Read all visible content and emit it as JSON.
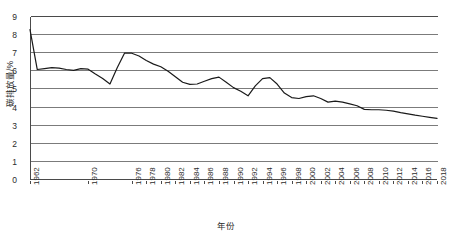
{
  "chart_data": {
    "type": "line",
    "title": "",
    "xlabel": "年份",
    "ylabel": "碳排放量/%",
    "xlim": [
      1962,
      2018
    ],
    "ylim": [
      0,
      9
    ],
    "grid": true,
    "legend": "none",
    "y_ticks": [
      9,
      8,
      7,
      6,
      5,
      4,
      3,
      2,
      1,
      0
    ],
    "x_ticks": [
      "1962",
      "1970",
      "1976",
      "1978",
      "1980",
      "1982",
      "1984",
      "1986",
      "1988",
      "1990",
      "1992",
      "1994",
      "1996",
      "1998",
      "2000",
      "2002",
      "2004",
      "2006",
      "2008",
      "2010",
      "2012",
      "2014",
      "2016",
      "2018"
    ],
    "line_color": "#1a1a1a",
    "grid_color": "#7b7b7b",
    "axis_color": "#4a4a4a",
    "series": [
      {
        "name": "碳排放量",
        "x": [
          1962,
          1963,
          1964,
          1965,
          1966,
          1967,
          1968,
          1969,
          1970,
          1971,
          1972,
          1973,
          1974,
          1975,
          1976,
          1977,
          1978,
          1979,
          1980,
          1981,
          1982,
          1983,
          1984,
          1985,
          1986,
          1987,
          1988,
          1989,
          1990,
          1991,
          1992,
          1993,
          1994,
          1995,
          1996,
          1997,
          1998,
          1999,
          2000,
          2001,
          2002,
          2003,
          2004,
          2005,
          2006,
          2007,
          2008,
          2009,
          2010,
          2011,
          2012,
          2013,
          2014,
          2015,
          2016,
          2017,
          2018
        ],
        "values": [
          8.3,
          6.1,
          6.15,
          6.2,
          6.18,
          6.1,
          6.05,
          6.15,
          6.12,
          5.85,
          5.6,
          5.3,
          6.2,
          7.0,
          7.0,
          6.85,
          6.6,
          6.4,
          6.25,
          6.0,
          5.7,
          5.4,
          5.28,
          5.3,
          5.45,
          5.6,
          5.68,
          5.4,
          5.1,
          4.9,
          4.65,
          5.2,
          5.6,
          5.65,
          5.3,
          4.8,
          4.55,
          4.5,
          4.6,
          4.65,
          4.5,
          4.3,
          4.35,
          4.3,
          4.2,
          4.1,
          3.9,
          3.88,
          3.88,
          3.85,
          3.8,
          3.72,
          3.65,
          3.58,
          3.52,
          3.46,
          3.4
        ]
      }
    ]
  }
}
